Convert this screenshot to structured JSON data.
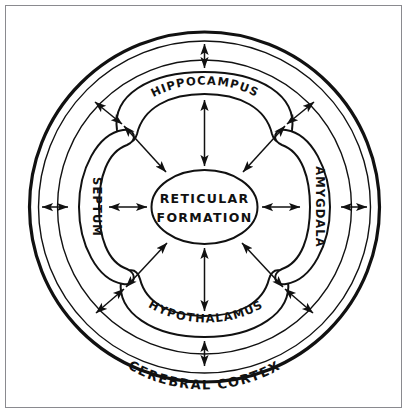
{
  "figure": {
    "background_color": "#ffffff",
    "ink_color": "#111111",
    "frame_color": "#8a8a8f"
  },
  "center": {
    "name": "reticular-formation",
    "line1": "RETICULAR",
    "line2": "FORMATION"
  },
  "structures": [
    {
      "id": "hippocampus",
      "label": "HIPPOCAMPUS",
      "position": "top"
    },
    {
      "id": "septum",
      "label": "SEPTUM",
      "position": "left"
    },
    {
      "id": "amygdala",
      "label": "AMYGDALA",
      "position": "right"
    },
    {
      "id": "hypothalamus",
      "label": "HYPOTHALAMUS",
      "position": "bottom"
    }
  ],
  "outer_ring": {
    "id": "cerebral-cortex",
    "label": "CEREBRAL   CORTEX",
    "position": "outer-band-bottom"
  },
  "connections": [
    {
      "from": "hippocampus",
      "to": "reticular-formation",
      "type": "bidirectional"
    },
    {
      "from": "hypothalamus",
      "to": "reticular-formation",
      "type": "bidirectional"
    },
    {
      "from": "septum",
      "to": "reticular-formation",
      "type": "bidirectional"
    },
    {
      "from": "amygdala",
      "to": "reticular-formation",
      "type": "bidirectional"
    },
    {
      "from": "septum",
      "to": "cerebral-cortex",
      "type": "bidirectional"
    },
    {
      "from": "amygdala",
      "to": "cerebral-cortex",
      "type": "bidirectional"
    },
    {
      "from": "hippocampus",
      "to": "cerebral-cortex",
      "type": "bidirectional"
    },
    {
      "from": "hypothalamus",
      "to": "cerebral-cortex",
      "type": "bidirectional"
    },
    {
      "from": "upper-left-junction",
      "to": "cerebral-cortex",
      "type": "bidirectional"
    },
    {
      "from": "upper-right-junction",
      "to": "cerebral-cortex",
      "type": "bidirectional"
    },
    {
      "from": "lower-left-junction",
      "to": "cerebral-cortex",
      "type": "bidirectional"
    },
    {
      "from": "lower-right-junction",
      "to": "cerebral-cortex",
      "type": "bidirectional"
    }
  ]
}
